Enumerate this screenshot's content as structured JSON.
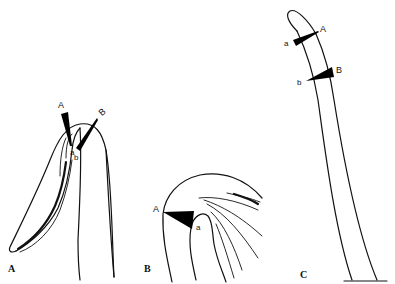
{
  "figure": {
    "panels": [
      {
        "id": "A",
        "label": "A",
        "description": "Curved elongated structure (lateral view) with two wedge markers",
        "markers": [
          {
            "label": "A",
            "tip_label": "a"
          },
          {
            "label": "B",
            "tip_label": "b"
          }
        ]
      },
      {
        "id": "B",
        "label": "B",
        "description": "Enlarged apical region with fanning inner lines and one wedge marker",
        "markers": [
          {
            "label": "A",
            "tip_label": "a"
          }
        ]
      },
      {
        "id": "C",
        "label": "C",
        "description": "Long slender tapering tube with two wedge markers and base line",
        "markers": [
          {
            "label": "A",
            "tip_label": "a"
          },
          {
            "label": "B",
            "tip_label": "b"
          }
        ]
      }
    ],
    "colors": {
      "line": "#111111",
      "wedge": "#000000",
      "background": "#ffffff"
    }
  }
}
